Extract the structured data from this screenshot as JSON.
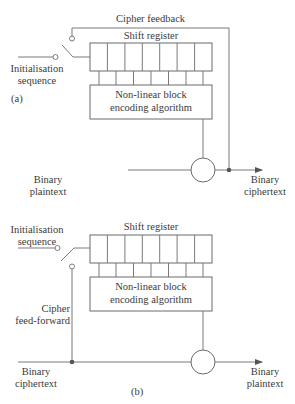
{
  "diagram": {
    "colors": {
      "line": "#7a7a7a",
      "text": "#3a3a3a",
      "background": "#ffffff"
    },
    "panel_a": {
      "label": "(a)",
      "feedback_label": "Cipher feedback",
      "shift_register_label": "Shift register",
      "algorithm_label_1": "Non-linear block",
      "algorithm_label_2": "encoding algorithm",
      "init_label_1": "Initialisation",
      "init_label_2": "sequence",
      "input_label_1": "Binary",
      "input_label_2": "plaintext",
      "output_label_1": "Binary",
      "output_label_2": "ciphertext",
      "xor_symbol": "⊕",
      "shift_register_cells": 7
    },
    "panel_b": {
      "label": "(b)",
      "feedforward_label_1": "Cipher",
      "feedforward_label_2": "feed-forward",
      "shift_register_label": "Shift register",
      "algorithm_label_1": "Non-linear block",
      "algorithm_label_2": "encoding algorithm",
      "init_label_1": "Initialisation",
      "init_label_2": "sequence",
      "input_label_1": "Binary",
      "input_label_2": "ciphertext",
      "output_label_1": "Binary",
      "output_label_2": "plaintext",
      "xor_symbol": "⊕",
      "shift_register_cells": 7
    }
  }
}
